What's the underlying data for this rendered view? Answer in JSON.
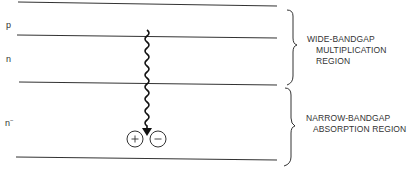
{
  "diagram": {
    "layers": [
      {
        "label": "p",
        "y_top": 3,
        "y_bottom": 35
      },
      {
        "label": "n",
        "y_top": 35,
        "y_bottom": 83
      },
      {
        "label": "n",
        "superscript": "−",
        "y_top": 83,
        "y_bottom": 158
      }
    ],
    "boundary_lines_y": [
      3,
      35,
      83,
      158
    ],
    "regions": [
      {
        "lines": [
          "WIDE-BANDGAP",
          "MULTIPLICATION",
          "REGION"
        ]
      },
      {
        "lines": [
          "NARROW-BANDGAP",
          "ABSORPTION REGION"
        ]
      }
    ],
    "photon": {
      "icon": "wavy-arrow-icon",
      "x": 147,
      "y_start": 30,
      "y_end": 132
    },
    "carriers": [
      {
        "symbol": "+",
        "name": "hole"
      },
      {
        "symbol": "−",
        "name": "electron"
      }
    ],
    "colors": {
      "line": "#333333",
      "text": "#333333",
      "background": "#ffffff"
    }
  }
}
